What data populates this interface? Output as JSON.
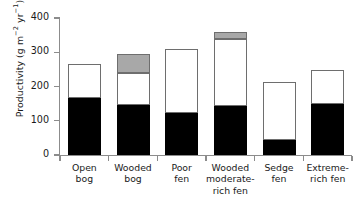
{
  "chart_data": {
    "type": "bar",
    "subtype": "stacked",
    "title": "",
    "xlabel": "",
    "ylabel": "Productivity (g m⁻² yr⁻¹)",
    "ylim": [
      0,
      400
    ],
    "yticks": [
      0,
      100,
      200,
      300,
      400
    ],
    "ytick_labels": [
      "0",
      "100",
      "200",
      "300",
      "400"
    ],
    "grid": false,
    "legend": "none",
    "categories": [
      "Open bog",
      "Wooded bog",
      "Poor fen",
      "Wooded moderate-rich fen",
      "Sedge fen",
      "Extreme-rich fen"
    ],
    "category_lines": [
      [
        "Open",
        "bog"
      ],
      [
        "Wooded",
        "bog"
      ],
      [
        "Poor",
        "fen"
      ],
      [
        "Wooded",
        "moderate-",
        "rich fen"
      ],
      [
        "Sedge",
        "fen"
      ],
      [
        "Extreme-",
        "rich fen"
      ]
    ],
    "series": [
      {
        "name": "black-segment",
        "color": "#000000",
        "values": [
          167,
          145,
          123,
          142,
          45,
          150
        ]
      },
      {
        "name": "white-segment",
        "color": "#ffffff",
        "values": [
          98,
          95,
          187,
          196,
          168,
          97
        ]
      },
      {
        "name": "gray-segment",
        "color": "#a8a8a8",
        "values": [
          0,
          55,
          0,
          20,
          0,
          0
        ]
      }
    ],
    "totals": [
      265,
      295,
      310,
      358,
      213,
      247
    ]
  },
  "axis": {
    "y_title_prefix": "Productivity (g m",
    "y_title_sup1": "−2",
    "y_title_mid": " yr",
    "y_title_sup2": "−1",
    "y_title_suffix": ")"
  }
}
